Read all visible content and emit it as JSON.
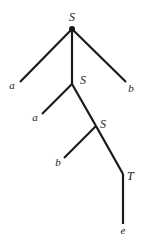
{
  "diagram": {
    "type": "parse-tree",
    "nodes": [
      {
        "id": "s1",
        "label": "S",
        "x": 72,
        "y": 29,
        "lx": 72,
        "ly": 21,
        "anchor": "middle"
      },
      {
        "id": "a1",
        "label": "a",
        "x": 20,
        "y": 82,
        "lx": 12,
        "ly": 89,
        "anchor": "middle"
      },
      {
        "id": "s2",
        "label": "S",
        "x": 72,
        "y": 84,
        "lx": 80,
        "ly": 84,
        "anchor": "start"
      },
      {
        "id": "b1",
        "label": "b",
        "x": 126,
        "y": 82,
        "lx": 131,
        "ly": 92,
        "anchor": "middle"
      },
      {
        "id": "a2",
        "label": "a",
        "x": 42,
        "y": 114,
        "lx": 35,
        "ly": 121,
        "anchor": "middle"
      },
      {
        "id": "s3",
        "label": "S",
        "x": 96,
        "y": 126,
        "lx": 100,
        "ly": 128,
        "anchor": "start"
      },
      {
        "id": "b2",
        "label": "b",
        "x": 64,
        "y": 158,
        "lx": 58,
        "ly": 166,
        "anchor": "middle"
      },
      {
        "id": "t1",
        "label": "T",
        "x": 123,
        "y": 174,
        "lx": 127,
        "ly": 180,
        "anchor": "start"
      },
      {
        "id": "e1",
        "label": "e",
        "x": 123,
        "y": 224,
        "lx": 123,
        "ly": 234,
        "anchor": "middle"
      }
    ],
    "edges": [
      [
        "s1",
        "a1"
      ],
      [
        "s1",
        "s2"
      ],
      [
        "s1",
        "b1"
      ],
      [
        "s2",
        "a2"
      ],
      [
        "s2",
        "s3"
      ],
      [
        "s3",
        "b2"
      ],
      [
        "s3",
        "t1"
      ],
      [
        "t1",
        "e1"
      ]
    ],
    "root_dot": {
      "x": 72,
      "y": 29,
      "r": 3
    },
    "colors": {
      "line": "#1a1a1a",
      "text": "#222222",
      "background": "#ffffff"
    }
  }
}
